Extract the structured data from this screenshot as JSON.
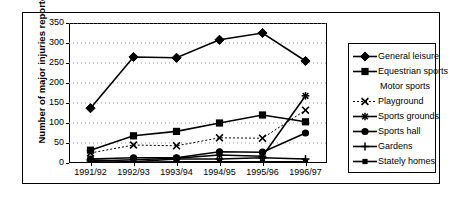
{
  "chart_data": {
    "type": "line",
    "title": "",
    "xlabel": "",
    "ylabel": "Number of major injuries reported",
    "categories": [
      "1991/92",
      "1992/93",
      "1993/94",
      "1994/95",
      "1995/96",
      "1996/97"
    ],
    "ylim": [
      0,
      350
    ],
    "ytick_values": [
      0,
      50,
      100,
      150,
      200,
      250,
      300,
      350
    ],
    "ytick_labels": [
      "0",
      "50",
      "100",
      "150",
      "200",
      "250",
      "300",
      "350"
    ],
    "grid": "horizontal dotted gridlines",
    "legend_position": "right",
    "series": [
      {
        "name": "General leisure",
        "marker": "diamond",
        "line": "solid",
        "values": [
          137,
          265,
          263,
          308,
          325,
          255
        ]
      },
      {
        "name": "Equestrian sports",
        "marker": "square",
        "line": "solid",
        "values": [
          32,
          68,
          79,
          100,
          120,
          103
        ]
      },
      {
        "name": "Motor sports",
        "marker": "none",
        "line": "none",
        "values": [
          0,
          0,
          0,
          0,
          0,
          0
        ]
      },
      {
        "name": "Playground",
        "marker": "cross-x",
        "line": "dotted",
        "values": [
          25,
          45,
          43,
          63,
          62,
          132
        ]
      },
      {
        "name": "Sports grounds",
        "marker": "asterisk",
        "line": "solid",
        "values": [
          5,
          8,
          12,
          20,
          17,
          168
        ]
      },
      {
        "name": "Sports hall",
        "marker": "circle",
        "line": "solid",
        "values": [
          10,
          13,
          13,
          28,
          27,
          75
        ]
      },
      {
        "name": "Gardens",
        "marker": "plus",
        "line": "solid",
        "values": [
          8,
          3,
          10,
          10,
          13,
          10
        ]
      },
      {
        "name": "Stately homes",
        "marker": "small-square",
        "line": "solid",
        "values": [
          3,
          2,
          3,
          3,
          3,
          3
        ]
      }
    ]
  },
  "colors": {
    "line": "#000000",
    "grid": "#999999",
    "axis": "#000000",
    "background": "#ffffff"
  }
}
